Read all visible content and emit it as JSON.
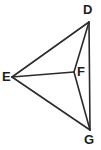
{
  "figure": {
    "kind": "geometry-diagram",
    "width": 101,
    "height": 150,
    "background_color": "#ffffff",
    "stroke_color": "#2b2b2b",
    "stroke_width": 1.6,
    "label_color": "#1d1d1d"
  },
  "points": [
    {
      "id": "D",
      "label": "D",
      "x": 89,
      "y": 22,
      "label_x": 83,
      "label_y": 3
    },
    {
      "id": "E",
      "label": "E",
      "x": 12,
      "y": 77,
      "label_x": 2,
      "label_y": 70
    },
    {
      "id": "F",
      "label": "F",
      "x": 74,
      "y": 72,
      "label_x": 77,
      "label_y": 65
    },
    {
      "id": "G",
      "label": "G",
      "x": 90,
      "y": 130,
      "label_x": 84,
      "label_y": 133
    }
  ],
  "segments": [
    {
      "id": "ED",
      "from": "E",
      "to": "D",
      "path": "M 12 77 L 89 22"
    },
    {
      "id": "EF",
      "from": "E",
      "to": "F",
      "path": "M 12 77 L 74 72"
    },
    {
      "id": "EG",
      "from": "E",
      "to": "G",
      "path": "M 12 77 L 90 130"
    },
    {
      "id": "DF",
      "from": "D",
      "to": "F",
      "path": "M 89 22 L 74 72"
    },
    {
      "id": "FG",
      "from": "F",
      "to": "G",
      "path": "M 74 72 L 90 130"
    },
    {
      "id": "DG",
      "from": "D",
      "to": "G",
      "path": "M 89 22 L 90 130"
    }
  ]
}
